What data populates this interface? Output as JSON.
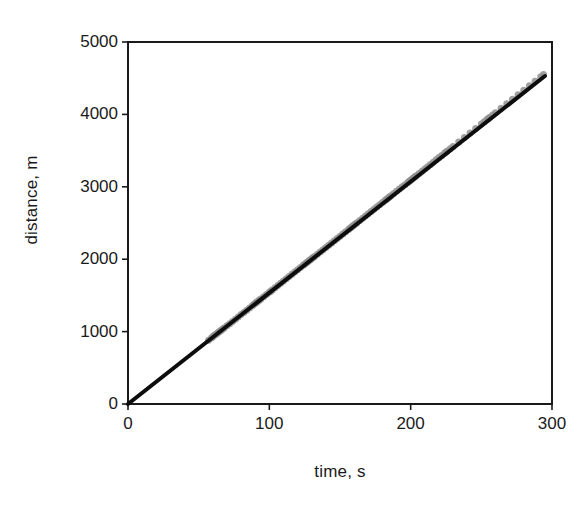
{
  "chart_data": {
    "type": "scatter",
    "title": "",
    "subtitle": "",
    "xlabel": "time, s",
    "ylabel": "distance, m",
    "xlim": [
      0,
      300
    ],
    "ylim": [
      0,
      5000
    ],
    "xticks": [
      0,
      100,
      200,
      300
    ],
    "yticks": [
      0,
      1000,
      2000,
      3000,
      4000,
      5000
    ],
    "xtick_labels": [
      "0",
      "100",
      "200",
      "300"
    ],
    "ytick_labels": [
      "0",
      "1000",
      "2000",
      "3000",
      "4000",
      "5000"
    ],
    "grid": false,
    "legend": null,
    "legend_position": "none",
    "annotations": [],
    "colors": {
      "marker": "#8f8f8f",
      "line": "#0d0d0d",
      "axis": "#1a1a1a",
      "background": "#ffffff"
    },
    "series": [
      {
        "name": "measured distance",
        "type": "scatter",
        "marker": "circle",
        "marker_color": "#8f8f8f",
        "marker_size": 7,
        "x": [
          57,
          59,
          60,
          61,
          62,
          63,
          64,
          65,
          66,
          67,
          68,
          70,
          72,
          74,
          76,
          78,
          80,
          82,
          84,
          86,
          88,
          89,
          90,
          91,
          92,
          93,
          94,
          96,
          98,
          100,
          101,
          102,
          104,
          106,
          108,
          110,
          112,
          114,
          116,
          118,
          120,
          122,
          124,
          125,
          126,
          127,
          128,
          129,
          130,
          131,
          132,
          134,
          136,
          138,
          140,
          142,
          144,
          146,
          148,
          150,
          152,
          154,
          156,
          157,
          158,
          159,
          160,
          161,
          162,
          164,
          166,
          168,
          170,
          172,
          174,
          176,
          178,
          180,
          182,
          183,
          184,
          185,
          186,
          188,
          190,
          192,
          194,
          196,
          198,
          199,
          200,
          201,
          202,
          203,
          204,
          206,
          208,
          210,
          212,
          214,
          216,
          218,
          220,
          222,
          224,
          225,
          226,
          228,
          230,
          234,
          238,
          242,
          246,
          250,
          252,
          254,
          255,
          256,
          258,
          260,
          264,
          268,
          272,
          276,
          280,
          284,
          288,
          292,
          294
        ],
        "y": [
          880,
          910,
          930,
          945,
          960,
          975,
          990,
          1005,
          1020,
          1035,
          1050,
          1080,
          1110,
          1140,
          1172,
          1203,
          1235,
          1265,
          1296,
          1327,
          1358,
          1374,
          1390,
          1405,
          1420,
          1435,
          1450,
          1481,
          1512,
          1543,
          1558,
          1575,
          1605,
          1636,
          1667,
          1698,
          1729,
          1760,
          1791,
          1822,
          1853,
          1884,
          1915,
          1930,
          1946,
          1961,
          1977,
          1992,
          2008,
          2023,
          2039,
          2070,
          2100,
          2130,
          2162,
          2193,
          2224,
          2255,
          2286,
          2317,
          2348,
          2380,
          2410,
          2426,
          2441,
          2457,
          2472,
          2488,
          2503,
          2534,
          2565,
          2596,
          2627,
          2658,
          2689,
          2720,
          2751,
          2782,
          2813,
          2829,
          2844,
          2860,
          2875,
          2906,
          2937,
          2968,
          2999,
          3030,
          3061,
          3077,
          3092,
          3108,
          3123,
          3139,
          3154,
          3185,
          3216,
          3247,
          3278,
          3309,
          3340,
          3372,
          3403,
          3434,
          3465,
          3480,
          3496,
          3527,
          3558,
          3620,
          3682,
          3744,
          3806,
          3868,
          3899,
          3930,
          3945,
          3961,
          3992,
          4023,
          4085,
          4147,
          4209,
          4271,
          4334,
          4396,
          4458,
          4520,
          4551
        ],
        "note": "gray circular markers, heavily overlapped along the trend"
      },
      {
        "name": "fit line",
        "type": "line",
        "line_color": "#0d0d0d",
        "line_width": 4,
        "x": [
          0,
          295
        ],
        "y": [
          0,
          4530
        ],
        "slope": 15.35,
        "intercept": 0,
        "note": "thick black trend line through the origin"
      }
    ]
  },
  "axes": {
    "x_axis_name": "time-axis",
    "y_axis_name": "distance-axis"
  }
}
